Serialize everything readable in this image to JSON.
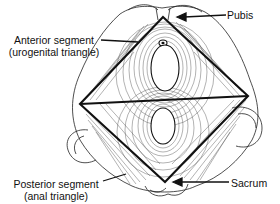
{
  "figure": {
    "labels": {
      "pubis": "Pubis",
      "sacrum": "Sacrum",
      "anterior": {
        "line1": "Anterior segment",
        "line2": "(urogenital triangle)"
      },
      "posterior": {
        "line1": "Posterior segment",
        "line2": "(anal triangle)"
      }
    },
    "colors": {
      "line": "#111111",
      "background": "#ffffff",
      "hatch": "#555555"
    },
    "geometry": {
      "top_apex": [
        163,
        17
      ],
      "left_vertex": [
        80,
        104
      ],
      "right_vertex": [
        248,
        96
      ],
      "bottom_apex": [
        165,
        182
      ]
    }
  }
}
